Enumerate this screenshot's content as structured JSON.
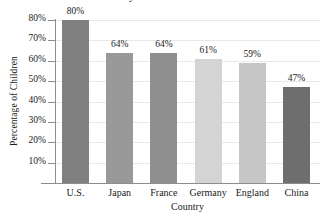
{
  "chart_data": {
    "type": "bar",
    "title": "Study Time of Children",
    "xlabel": "Country",
    "ylabel": "Percentage of Children",
    "categories": [
      "U.S.",
      "Japan",
      "France",
      "Germany",
      "England",
      "China"
    ],
    "values": [
      80,
      64,
      64,
      61,
      59,
      47
    ],
    "value_labels": [
      "80%",
      "64%",
      "64%",
      "61%",
      "59%",
      "47%"
    ],
    "bar_colors": [
      "#808080",
      "#999999",
      "#8f8f8f",
      "#d4d4d4",
      "#c6c6c6",
      "#6e6e6e"
    ],
    "ylim": [
      0,
      85
    ],
    "y_ticks": [
      10,
      20,
      30,
      40,
      50,
      60,
      70,
      80
    ],
    "y_tick_labels": [
      "10%",
      "20%",
      "30%",
      "40%",
      "50%",
      "60%",
      "70%",
      "80%"
    ],
    "grid": true,
    "legend": false
  }
}
